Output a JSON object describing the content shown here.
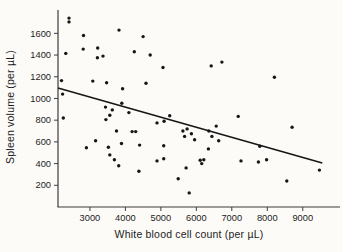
{
  "figure": {
    "background": "#fcfbf8",
    "dot_color": "#161616",
    "trend_color": "#161616",
    "axis_color": "#3d3d3d",
    "tick_text_color": "#1c1c1c"
  },
  "chart_data": {
    "type": "scatter",
    "title": "",
    "xlabel": "White blood cell count (per µL)",
    "ylabel": "Spleen volume (per µL)",
    "grid": false,
    "legend": null,
    "x_axis": {
      "min": 2100,
      "max": 10050,
      "ticks": [
        3000,
        4000,
        5000,
        6000,
        7000,
        8000,
        9000
      ]
    },
    "y_axis": {
      "min": 0,
      "max": 1815,
      "ticks": [
        200,
        400,
        600,
        800,
        1000,
        1200,
        1400,
        1600
      ]
    },
    "points": [
      [
        2410,
        1740
      ],
      [
        2410,
        1705
      ],
      [
        2820,
        1580
      ],
      [
        3820,
        1630
      ],
      [
        4500,
        1570
      ],
      [
        2320,
        1415
      ],
      [
        2810,
        1455
      ],
      [
        3220,
        1465
      ],
      [
        3210,
        1375
      ],
      [
        3370,
        1390
      ],
      [
        4250,
        1430
      ],
      [
        4700,
        1400
      ],
      [
        5060,
        1285
      ],
      [
        6420,
        1300
      ],
      [
        6720,
        1335
      ],
      [
        8200,
        1195
      ],
      [
        3080,
        1160
      ],
      [
        3470,
        1145
      ],
      [
        4580,
        1140
      ],
      [
        3920,
        1090
      ],
      [
        2200,
        1165
      ],
      [
        2230,
        1040
      ],
      [
        2250,
        820
      ],
      [
        3440,
        920
      ],
      [
        3630,
        895
      ],
      [
        3900,
        955
      ],
      [
        4100,
        870
      ],
      [
        3560,
        845
      ],
      [
        3450,
        805
      ],
      [
        5250,
        840
      ],
      [
        7180,
        835
      ],
      [
        3750,
        700
      ],
      [
        4190,
        695
      ],
      [
        4290,
        695
      ],
      [
        4890,
        775
      ],
      [
        5090,
        790
      ],
      [
        5620,
        700
      ],
      [
        5740,
        720
      ],
      [
        5860,
        675
      ],
      [
        5670,
        650
      ],
      [
        5950,
        620
      ],
      [
        6350,
        700
      ],
      [
        6440,
        650
      ],
      [
        6560,
        745
      ],
      [
        8700,
        735
      ],
      [
        3160,
        610
      ],
      [
        2900,
        545
      ],
      [
        3520,
        550
      ],
      [
        3890,
        585
      ],
      [
        4400,
        570
      ],
      [
        3560,
        480
      ],
      [
        3690,
        435
      ],
      [
        3810,
        380
      ],
      [
        4380,
        330
      ],
      [
        5080,
        565
      ],
      [
        4890,
        425
      ],
      [
        5080,
        445
      ],
      [
        6110,
        430
      ],
      [
        6210,
        435
      ],
      [
        6150,
        400
      ],
      [
        6340,
        535
      ],
      [
        6630,
        610
      ],
      [
        7260,
        425
      ],
      [
        7790,
        560
      ],
      [
        7750,
        415
      ],
      [
        7980,
        435
      ],
      [
        9470,
        340
      ],
      [
        5710,
        360
      ],
      [
        5490,
        260
      ],
      [
        5800,
        130
      ],
      [
        8550,
        240
      ]
    ],
    "trendline": {
      "x1": 2100,
      "y1": 1095,
      "x2": 9550,
      "y2": 405
    }
  }
}
